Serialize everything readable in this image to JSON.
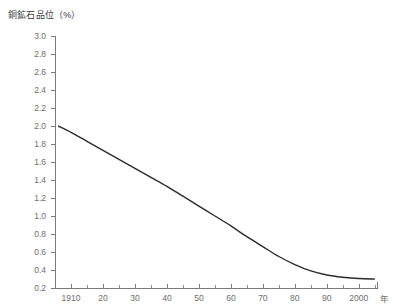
{
  "chart_data": {
    "type": "line",
    "title": "銅鉱石品位（%）",
    "xlabel": "年",
    "ylabel": "",
    "ylim": [
      0.2,
      3.0
    ],
    "xlim": [
      1905,
      2006
    ],
    "grid": false,
    "legend": null,
    "y_ticks": [
      "3.0",
      "2.8",
      "2.6",
      "2.4",
      "2.2",
      "2.0",
      "1.8",
      "1.6",
      "1.4",
      "1.2",
      "1.0",
      "0.8",
      "0.6",
      "0.4",
      "0.2"
    ],
    "y_tick_values": [
      3.0,
      2.8,
      2.6,
      2.4,
      2.2,
      2.0,
      1.8,
      1.6,
      1.4,
      1.2,
      1.0,
      0.8,
      0.6,
      0.4,
      0.2
    ],
    "x_ticks": [
      "1910",
      "20",
      "30",
      "40",
      "50",
      "60",
      "70",
      "80",
      "90",
      "2000"
    ],
    "x_tick_values": [
      1910,
      1920,
      1930,
      1940,
      1950,
      1960,
      1970,
      1980,
      1990,
      2000
    ],
    "x_minor_values": [
      1915,
      1925,
      1935,
      1945,
      1955,
      1965,
      1975,
      1985,
      1995,
      2005
    ],
    "series": [
      {
        "name": "銅鉱石品位",
        "x": [
          1906,
          1910,
          1915,
          1920,
          1925,
          1930,
          1935,
          1940,
          1945,
          1950,
          1955,
          1960,
          1965,
          1970,
          1975,
          1980,
          1985,
          1990,
          1995,
          2000,
          2005
        ],
        "values": [
          2.0,
          1.93,
          1.83,
          1.73,
          1.63,
          1.53,
          1.43,
          1.33,
          1.22,
          1.11,
          1.0,
          0.89,
          0.77,
          0.66,
          0.55,
          0.46,
          0.39,
          0.345,
          0.32,
          0.305,
          0.3
        ]
      }
    ],
    "colors": {
      "curve": "#2b2b2b",
      "axis": "#7a7a7a",
      "tick_text": "#6e6e6e",
      "title_text": "#3c3c3c",
      "background": "#ffffff"
    }
  },
  "geometry": {
    "plot_left": 55,
    "plot_right": 378,
    "plot_top": 36,
    "plot_bottom": 288,
    "x_value_left": 1905,
    "x_value_right": 2006,
    "y_value_top": 3.0,
    "y_value_bottom": 0.2
  }
}
